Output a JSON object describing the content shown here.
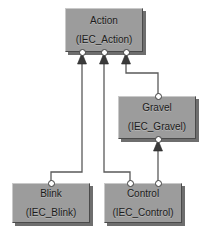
{
  "diagram": {
    "kind": "uml-inheritance-diagram",
    "background_color": "#ffffff",
    "node_fill_color": "#9c9c9c",
    "node_border_light": "#c9c9c9",
    "node_border_dark": "#4a4a4a",
    "edge_color": "#5a5a5a",
    "port_fill_color": "#ffffff",
    "nodes": [
      {
        "id": "action",
        "name": "Action",
        "stereotype": "(IEC_Action)",
        "x": 65,
        "y": 8,
        "width": 78,
        "height": 44
      },
      {
        "id": "gravel",
        "name": "Gravel",
        "stereotype": "(IEC_Gravel)",
        "x": 118,
        "y": 96,
        "width": 78,
        "height": 43
      },
      {
        "id": "blink",
        "name": "Blink",
        "stereotype": "(IEC_Blink)",
        "x": 12,
        "y": 183,
        "width": 78,
        "height": 40
      },
      {
        "id": "control",
        "name": "Control",
        "stereotype": "(IEC_Control)",
        "x": 104,
        "y": 183,
        "width": 78,
        "height": 40
      }
    ],
    "ports": [
      {
        "id": "action-port-left",
        "x": 82,
        "y": 52
      },
      {
        "id": "action-port-center",
        "x": 104,
        "y": 52
      },
      {
        "id": "action-port-right",
        "x": 126,
        "y": 52
      },
      {
        "id": "gravel-port-top",
        "x": 158,
        "y": 96
      },
      {
        "id": "gravel-port-bottom",
        "x": 158,
        "y": 139
      },
      {
        "id": "blink-port-top",
        "x": 51,
        "y": 183
      },
      {
        "id": "control-port-left",
        "x": 130,
        "y": 183
      },
      {
        "id": "control-port-right",
        "x": 158,
        "y": 183
      }
    ],
    "edges": [
      {
        "id": "blink-to-action",
        "from": "blink",
        "to": "action",
        "relation": "generalization",
        "points": "51,183 51,172 82,172 82,62"
      },
      {
        "id": "control-to-action",
        "from": "control",
        "to": "action",
        "relation": "generalization",
        "points": "130,183 130,172 104,172 104,62"
      },
      {
        "id": "gravel-to-action",
        "from": "gravel",
        "to": "action",
        "relation": "generalization",
        "points": "158,96 158,73 126,73 126,62"
      },
      {
        "id": "control-to-gravel",
        "from": "control",
        "to": "gravel",
        "relation": "generalization",
        "points": "158,183 158,149"
      }
    ],
    "arrowheads": [
      {
        "id": "arrow-into-action-left",
        "x": 82,
        "y": 55
      },
      {
        "id": "arrow-into-action-center",
        "x": 104,
        "y": 55
      },
      {
        "id": "arrow-into-action-right",
        "x": 126,
        "y": 55
      },
      {
        "id": "arrow-into-gravel-bottom",
        "x": 158,
        "y": 142
      }
    ]
  }
}
